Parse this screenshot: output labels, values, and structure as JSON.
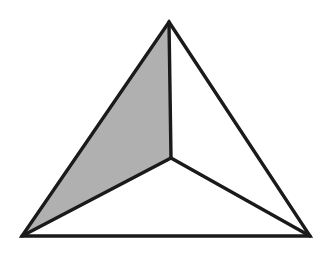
{
  "page": {
    "background_color": "#ffffff",
    "width": 325,
    "height": 258,
    "caption": ""
  },
  "figure": {
    "name": "subdivided-triangle",
    "stroke_color": "#1a1a1a",
    "stroke_width": 3.4,
    "shaded_fill": "#b0b0b0",
    "unshaded_fill": "#ffffff",
    "vertices": {
      "apex": {
        "label": "apex",
        "x": 169,
        "y": 22
      },
      "bottom_left": {
        "label": "bottom-left",
        "x": 22,
        "y": 236
      },
      "bottom_right": {
        "label": "bottom-right",
        "x": 310,
        "y": 236
      },
      "center": {
        "label": "interior-center",
        "x": 171,
        "y": 158
      }
    },
    "outer_triangle": {
      "name": "outer-triangle",
      "points": "169,22 310,236 22,236"
    },
    "sectors": [
      {
        "name": "left-sector",
        "shaded": true,
        "fill": "#b0b0b0",
        "points": "169,22 171,158 22,236"
      },
      {
        "name": "right-sector",
        "shaded": false,
        "fill": "#ffffff",
        "points": "169,22 310,236 171,158"
      },
      {
        "name": "bottom-sector",
        "shaded": false,
        "fill": "#ffffff",
        "points": "171,158 310,236 22,236"
      }
    ],
    "spokes": [
      {
        "name": "spoke-center-to-apex",
        "x1": 171,
        "y1": 158,
        "x2": 169,
        "y2": 22
      },
      {
        "name": "spoke-center-to-bottom-right",
        "x1": 171,
        "y1": 158,
        "x2": 310,
        "y2": 236
      },
      {
        "name": "spoke-center-to-bottom-left",
        "x1": 171,
        "y1": 158,
        "x2": 22,
        "y2": 236
      }
    ]
  }
}
